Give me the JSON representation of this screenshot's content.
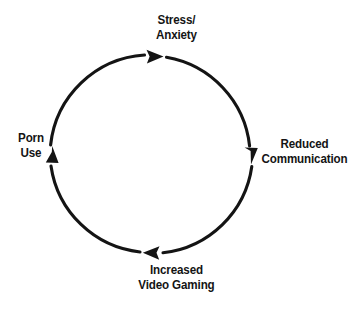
{
  "diagram": {
    "type": "cycle",
    "direction": "clockwise",
    "background_color": "#ffffff",
    "stroke_color": "#141414",
    "text_color": "#141414",
    "circle": {
      "center_x": 151,
      "center_y": 154,
      "radius": 101,
      "stroke_width": 3
    },
    "nodes": [
      {
        "id": "stress-anxiety",
        "position": "top",
        "lines": [
          "Stress/",
          "Anxiety"
        ],
        "line1": "Stress/",
        "line2": "Anxiety"
      },
      {
        "id": "reduced-communication",
        "position": "right",
        "lines": [
          "Reduced",
          "Communication"
        ],
        "line1": "Reduced",
        "line2": "Communication"
      },
      {
        "id": "increased-video-gaming",
        "position": "bottom",
        "lines": [
          "Increased",
          "Video Gaming"
        ],
        "line1": "Increased",
        "line2": "Video Gaming"
      },
      {
        "id": "porn-use",
        "position": "left",
        "lines": [
          "Porn",
          "Use"
        ],
        "line1": "Porn",
        "line2": "Use"
      }
    ],
    "arrowheads": [
      {
        "id": "arrow-top",
        "points": "right",
        "x": 155,
        "y": 56
      },
      {
        "id": "arrow-right",
        "points": "down",
        "x": 251,
        "y": 156
      },
      {
        "id": "arrow-bottom",
        "points": "left",
        "x": 151,
        "y": 253
      },
      {
        "id": "arrow-left",
        "points": "up",
        "x": 52,
        "y": 156
      }
    ]
  }
}
